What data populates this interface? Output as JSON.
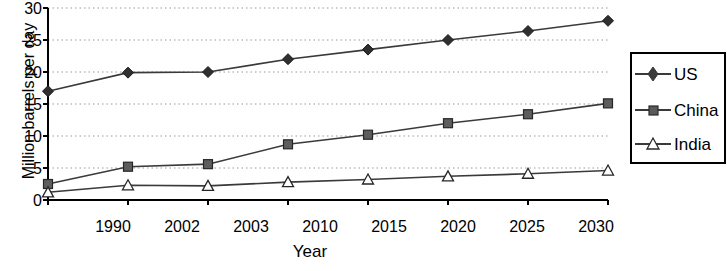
{
  "chart_data": {
    "type": "line",
    "title": "",
    "xlabel": "Year",
    "ylabel": "Million barrels per day",
    "categories": [
      "1990",
      "2002",
      "2003",
      "2010",
      "2015",
      "2020",
      "2025",
      "2030"
    ],
    "yticks": [
      "0",
      "5",
      "10",
      "15",
      "20",
      "25",
      "30"
    ],
    "ylim": [
      0,
      30
    ],
    "grid": true,
    "legend_position": "right-outside",
    "series": [
      {
        "name": "US",
        "marker": "diamond",
        "values": [
          17.0,
          19.9,
          20.0,
          22.0,
          23.5,
          25.0,
          26.4,
          28.0
        ]
      },
      {
        "name": "China",
        "marker": "square",
        "values": [
          2.5,
          5.2,
          5.6,
          8.7,
          10.2,
          12.0,
          13.4,
          15.1
        ]
      },
      {
        "name": "India",
        "marker": "triangle",
        "values": [
          1.2,
          2.3,
          2.2,
          2.8,
          3.2,
          3.7,
          4.1,
          4.6
        ]
      }
    ],
    "colors": {
      "line": "#3a3a3a",
      "axis": "#000000",
      "grid": "#9a9a9a",
      "background": "#ffffff"
    }
  },
  "legend": {
    "items": [
      {
        "label": "US"
      },
      {
        "label": "China"
      },
      {
        "label": "India"
      }
    ]
  }
}
